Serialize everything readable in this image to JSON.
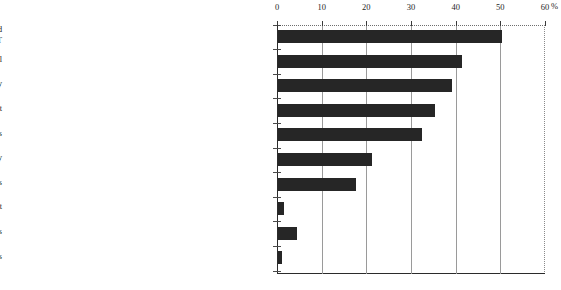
{
  "chart_data": {
    "type": "bar",
    "orientation": "horizontal",
    "title": "",
    "xlabel": "",
    "ylabel": "",
    "unit": "%",
    "xlim": [
      0,
      60
    ],
    "ticks": [
      0,
      10,
      20,
      30,
      40,
      50,
      60
    ],
    "grid": true,
    "legend": "none",
    "bar_color": "#262626",
    "categories": [
      "Serious lack of professional personnel to drive the increased use of computers and\nIT",
      "Insufficient workers' re-education for improvement of their IT utilization skill",
      "Obsolescence caused by rapid innovations in IT technology",
      "Lower cost effectiveness of IT investment",
      "Too high communication fees",
      "Difficulty in ensuring the information security",
      "Lack of hardware and software that matches operations",
      "Incompatibility with personnel policies to maintain employment",
      "No particular problems",
      "Others"
    ],
    "values": [
      50.1,
      41.3,
      38.9,
      35.1,
      32.2,
      21.0,
      17.4,
      1.3,
      4.2,
      1.0
    ]
  },
  "axis": {
    "tick_labels": [
      "0",
      "10",
      "20",
      "30",
      "40",
      "50",
      "60"
    ],
    "unit_label": "%"
  }
}
